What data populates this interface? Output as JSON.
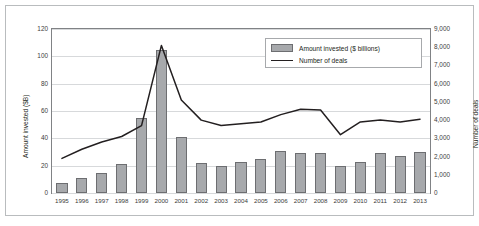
{
  "chart_data": {
    "type": "bar",
    "title": "",
    "xlabel": "",
    "ylabel": "Amount invested ($B)",
    "y2label": "Number of deals",
    "grid": true,
    "legend_position": "top-right",
    "ylim": [
      0,
      120
    ],
    "y2lim": [
      0,
      9000
    ],
    "yticks": [
      "0",
      "20",
      "40",
      "60",
      "80",
      "100",
      "120"
    ],
    "y2ticks": [
      "0",
      "1,000",
      "2,000",
      "3,000",
      "4,000",
      "5,000",
      "6,000",
      "7,000",
      "8,000",
      "9,000"
    ],
    "categories": [
      "1995",
      "1996",
      "1997",
      "1998",
      "1999",
      "2000",
      "2001",
      "2002",
      "2003",
      "2004",
      "2005",
      "2006",
      "2007",
      "2008",
      "2009",
      "2010",
      "2011",
      "2012",
      "2013"
    ],
    "series": [
      {
        "name": "Amount invested ($ billions)",
        "type": "bar",
        "axis": "left",
        "color": "#a7a9ac",
        "values": [
          7,
          11,
          15,
          21,
          55,
          105,
          41,
          22,
          20,
          23,
          25,
          31,
          29,
          29,
          20,
          23,
          29,
          27,
          30
        ]
      },
      {
        "name": "Number of deals",
        "type": "line",
        "axis": "right",
        "color": "#231f20",
        "values": [
          1900,
          2400,
          2800,
          3100,
          3700,
          8100,
          5100,
          4000,
          3700,
          3800,
          3900,
          4300,
          4600,
          4550,
          3200,
          3900,
          4000,
          3900,
          4050
        ]
      }
    ]
  },
  "legend": {
    "items": [
      {
        "label": "Amount invested ($ billions)",
        "marker": "bar-swatch"
      },
      {
        "label": "Number of deals",
        "marker": "line-swatch"
      }
    ]
  }
}
